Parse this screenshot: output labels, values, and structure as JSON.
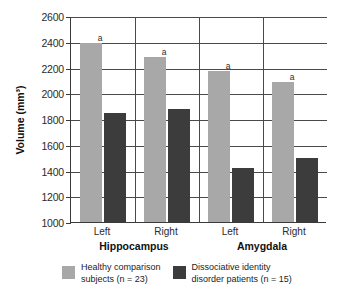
{
  "figure": {
    "cropped_caption": "",
    "yaxis_title": "Volume (mm³)"
  },
  "chart_data": {
    "type": "bar",
    "title": "",
    "xlabel": "",
    "ylabel": "Volume (mm³)",
    "ylim": [
      1000,
      2600
    ],
    "yticks": [
      1000,
      1200,
      1400,
      1600,
      1800,
      2000,
      2200,
      2400,
      2600
    ],
    "ytick_labels": [
      "1000",
      "1200",
      "1400",
      "1600",
      "1800",
      "2000",
      "2200",
      "2400",
      "2600"
    ],
    "grid": true,
    "legend_position": "bottom",
    "groups": [
      {
        "name": "Hippocampus",
        "sides": [
          "Left",
          "Right"
        ]
      },
      {
        "name": "Amygdala",
        "sides": [
          "Left",
          "Right"
        ]
      }
    ],
    "categories": [
      "Hippocampus Left",
      "Hippocampus Right",
      "Amygdala Left",
      "Amygdala Right"
    ],
    "series": [
      {
        "name": "Healthy comparison subjects (n = 23)",
        "color": "#a8a8a8",
        "values": [
          2390,
          2280,
          2170,
          2090
        ],
        "annotations": [
          "a",
          "a",
          "a",
          "a"
        ]
      },
      {
        "name": "Dissociative identity disorder patients (n = 15)",
        "color": "#3c3c3c",
        "values": [
          1845,
          1880,
          1420,
          1500
        ],
        "annotations": [
          "",
          "",
          "",
          ""
        ]
      }
    ],
    "annotation_note": "a"
  },
  "legend": {
    "items": [
      {
        "swatch": "light",
        "line1": "Healthy comparison",
        "line2": "subjects (n = 23)",
        "text": "Healthy comparison\nsubjects (n = 23)"
      },
      {
        "swatch": "dark",
        "line1": "Dissociative identity",
        "line2": "disorder patients (n = 15)",
        "text": "Dissociative identity\ndisorder patients (n = 15)"
      }
    ]
  },
  "axis_labels": {
    "sides": [
      "Left",
      "Right",
      "Left",
      "Right"
    ],
    "groups": [
      "Hippocampus",
      "Amygdala"
    ]
  }
}
